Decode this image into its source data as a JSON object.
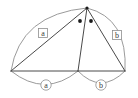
{
  "figure": {
    "type": "geometry-diagram",
    "title": "",
    "colors": {
      "background": "#ffffff",
      "stroke": "#4a4a4a",
      "arc_stroke": "#8c8c8c",
      "label_box_stroke": "#8c8c8c",
      "label_text": "#3a3a3a",
      "dot_fill": "#1a1a1a"
    },
    "vertices": [
      {
        "name": "left-vertex",
        "x": 11,
        "y": 71
      },
      {
        "name": "middle-base-vertex",
        "x": 78,
        "y": 71
      },
      {
        "name": "right-vertex",
        "x": 125,
        "y": 71
      },
      {
        "name": "apex-vertex",
        "x": 87,
        "y": 8
      }
    ],
    "segments": [
      {
        "name": "segment-left-to-apex",
        "from": "left-vertex",
        "to": "apex-vertex"
      },
      {
        "name": "segment-left-to-middle",
        "from": "left-vertex",
        "to": "middle-base-vertex"
      },
      {
        "name": "segment-middle-to-right",
        "from": "middle-base-vertex",
        "to": "right-vertex"
      },
      {
        "name": "segment-apex-to-middle",
        "from": "apex-vertex",
        "to": "middle-base-vertex"
      },
      {
        "name": "segment-apex-to-right",
        "from": "apex-vertex",
        "to": "right-vertex"
      }
    ],
    "arcs": [
      {
        "name": "arc-upper-left",
        "label": "a",
        "label_style": "box",
        "label_x": 43,
        "label_y": 33
      },
      {
        "name": "arc-upper-right",
        "label": "b",
        "label_style": "box",
        "label_x": 117,
        "label_y": 35
      },
      {
        "name": "arc-lower-left",
        "label": "a",
        "label_style": "circle",
        "label_x": 46,
        "label_y": 85
      },
      {
        "name": "arc-lower-right",
        "label": "b",
        "label_style": "circle",
        "label_x": 101,
        "label_y": 85
      }
    ],
    "markers": [
      {
        "name": "apex-point-dot",
        "x": 87,
        "y": 8,
        "r": 1.6
      },
      {
        "name": "angle-mark-dot-left",
        "x": 80,
        "y": 21,
        "r": 1.8
      },
      {
        "name": "angle-mark-dot-right",
        "x": 91,
        "y": 21,
        "r": 1.8
      }
    ],
    "labels": {
      "upper_left": "a",
      "upper_right": "b",
      "lower_left": "a",
      "lower_right": "b"
    }
  }
}
